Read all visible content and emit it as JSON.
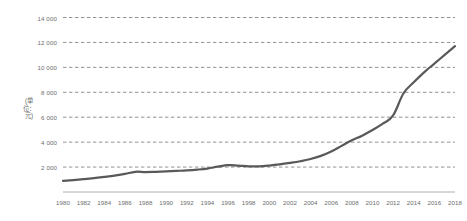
{
  "chart_data": {
    "type": "line",
    "title": "",
    "subtitle": "",
    "xlabel": "",
    "ylabel": "(单位：元)",
    "ylim": [
      0,
      14000
    ],
    "xlim": [
      1980,
      2018
    ],
    "grid": true,
    "grid_style": "dashed-horizontal",
    "legend": "none",
    "line_color": "#595959",
    "y_ticks": [
      2000,
      4000,
      6000,
      8000,
      10000,
      12000,
      14000
    ],
    "y_tick_labels": [
      "2 000",
      "4 000",
      "6 000",
      "8 000",
      "10 000",
      "12 000",
      "14 000"
    ],
    "x_tick_labels": [
      "1980",
      "1982",
      "1984",
      "1986",
      "1988",
      "1990",
      "1992",
      "1994",
      "1996",
      "1998",
      "2000",
      "2002",
      "2004",
      "2006",
      "2008",
      "2010",
      "2012",
      "2014",
      "2016",
      "2018"
    ],
    "x": [
      1980,
      1981,
      1982,
      1983,
      1984,
      1985,
      1986,
      1987,
      1988,
      1989,
      1990,
      1991,
      1992,
      1993,
      1994,
      1995,
      1996,
      1997,
      1998,
      1999,
      2000,
      2001,
      2002,
      2003,
      2004,
      2005,
      2006,
      2007,
      2008,
      2009,
      2010,
      2011,
      2012,
      2013,
      2014,
      2015,
      2016,
      2017,
      2018
    ],
    "series": [
      {
        "name": "单位：元",
        "values": [
          900,
          960,
          1030,
          1110,
          1210,
          1320,
          1450,
          1620,
          1600,
          1620,
          1650,
          1690,
          1730,
          1790,
          1880,
          2030,
          2160,
          2120,
          2060,
          2060,
          2120,
          2210,
          2330,
          2470,
          2650,
          2900,
          3250,
          3700,
          4150,
          4520,
          4980,
          5480,
          6150,
          7900,
          8800,
          9600,
          10300,
          11000,
          11700
        ]
      }
    ]
  }
}
